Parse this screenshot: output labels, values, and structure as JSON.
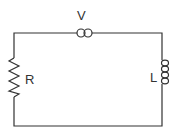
{
  "diagram": {
    "type": "circuit",
    "topology": "series loop",
    "components": [
      {
        "id": "source",
        "symbol": "ac-source-double-circle",
        "label": "V",
        "position": "top"
      },
      {
        "id": "resistor",
        "symbol": "resistor-zigzag",
        "label": "R",
        "position": "left"
      },
      {
        "id": "inductor",
        "symbol": "inductor-coil",
        "label": "L",
        "position": "right"
      }
    ],
    "colors": {
      "line": "#333333",
      "background": "#ffffff"
    }
  }
}
